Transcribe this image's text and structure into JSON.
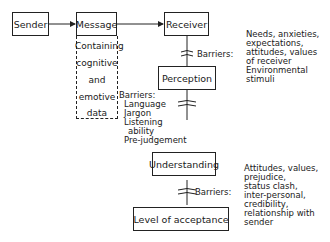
{
  "nodes": {
    "sender": "Sender",
    "message": "Message",
    "receiver": "Receiver",
    "perception": "Perception",
    "understanding": "Understanding",
    "acceptance": "Level of acceptance"
  },
  "message_note": [
    "Containing",
    "cognitive",
    "and",
    "emotive",
    "data"
  ],
  "barriers": {
    "receiver_perception": {
      "label": "Barriers:",
      "items": [
        "Needs, anxieties,",
        "expectations,",
        "attitudes, values",
        "of receiver",
        "Environmental",
        "stimuli"
      ]
    },
    "perception_understanding": {
      "label": "Barriers:",
      "items": [
        "Language",
        "Jargon",
        "Listening",
        "ability",
        "Pre-judgement"
      ]
    },
    "understanding_acceptance": {
      "label": "Barriers:",
      "items": [
        "Attitudes, values,",
        "prejudice,",
        "status clash,",
        "inter-personal,",
        "credibility,",
        "relationship with",
        "sender"
      ]
    }
  }
}
